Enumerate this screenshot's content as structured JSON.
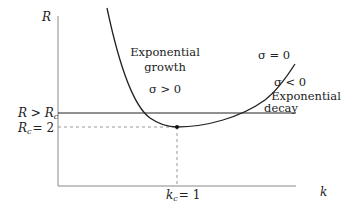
{
  "diagram": {
    "axes": {
      "y_label": "R",
      "x_label": "k"
    },
    "regions": {
      "growth_title_line1": "Exponential",
      "growth_title_line2": "growth",
      "growth_condition": "σ > 0",
      "neutral_condition": "σ = 0",
      "decay_condition": "σ < 0",
      "decay_title_line1": "Exponential",
      "decay_title_line2": "decay"
    },
    "levels": {
      "upper_label": "R > R",
      "upper_label_sub": "c",
      "critical_label": "R",
      "critical_label_sub": "c",
      "critical_value_text": "= 2",
      "critical_R": 2
    },
    "critical_k": {
      "label": "k",
      "label_sub": "c",
      "value_text": "= 1",
      "value": 1
    },
    "colors": {
      "axis": "#888888",
      "curve": "#222222",
      "dashed": "#999999"
    }
  }
}
